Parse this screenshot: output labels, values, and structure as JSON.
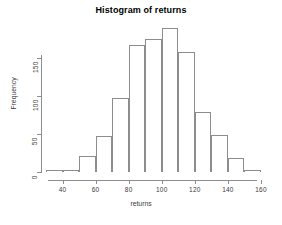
{
  "chart_data": {
    "type": "bar",
    "title": "Histogram of returns",
    "xlabel": "returns",
    "ylabel": "Frequency",
    "subtitle": "",
    "grid": false,
    "legend": null,
    "legend_position": "none",
    "bin_width": 10,
    "bin_edges": [
      30,
      40,
      50,
      60,
      70,
      80,
      90,
      100,
      110,
      120,
      130,
      140,
      150,
      160
    ],
    "categories": [
      "30-40",
      "40-50",
      "50-60",
      "60-70",
      "70-80",
      "80-90",
      "90-100",
      "100-110",
      "110-120",
      "120-130",
      "130-140",
      "140-150",
      "150-160"
    ],
    "bin_centers": [
      35,
      45,
      55,
      65,
      75,
      85,
      95,
      105,
      115,
      125,
      135,
      145,
      155
    ],
    "values": [
      3,
      3,
      21,
      48,
      97,
      168,
      175,
      190,
      158,
      79,
      49,
      18,
      3
    ],
    "xlim": [
      30,
      160
    ],
    "ylim": [
      0,
      190
    ],
    "x_ticks": [
      40,
      60,
      80,
      100,
      120,
      140,
      160
    ],
    "x_tick_labels": [
      "40",
      "60",
      "80",
      "100",
      "120",
      "140",
      "160"
    ],
    "y_ticks": [
      0,
      50,
      100,
      150
    ],
    "y_tick_labels": [
      "0",
      "50",
      "100",
      "150"
    ],
    "bar_border_color": "#8d8d8d",
    "bar_fill_color": "#ffffff",
    "axis_color": "#8d8d8d",
    "text_color": "#3a3a3a",
    "title_color": "#000000",
    "background_color": "#ffffff"
  }
}
